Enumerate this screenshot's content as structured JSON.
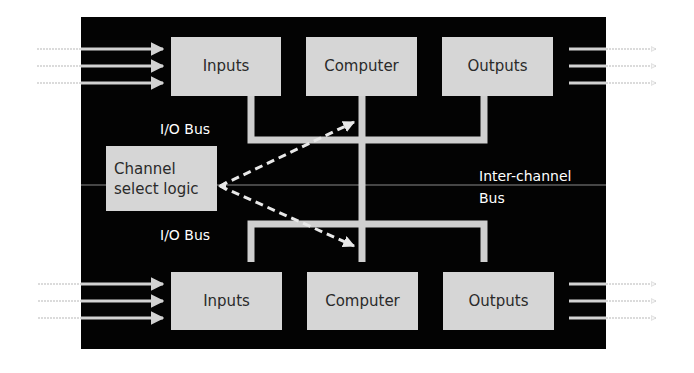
{
  "diagram": {
    "channel_top": {
      "inputs": "Inputs",
      "computer": "Computer",
      "outputs": "Outputs",
      "bus_label": "I/O Bus"
    },
    "channel_bottom": {
      "inputs": "Inputs",
      "computer": "Computer",
      "outputs": "Outputs",
      "bus_label": "I/O Bus"
    },
    "channel_select": {
      "line1": "Channel",
      "line2": "select logic"
    },
    "inter_channel_bus": {
      "line1": "Inter-channel",
      "line2": "Bus"
    },
    "colors": {
      "background": "#030303",
      "box": "#d6d6d6",
      "bus": "#cfcfcf",
      "text_on_dark": "#ffffff",
      "text_on_box": "#2a2a2a"
    }
  }
}
